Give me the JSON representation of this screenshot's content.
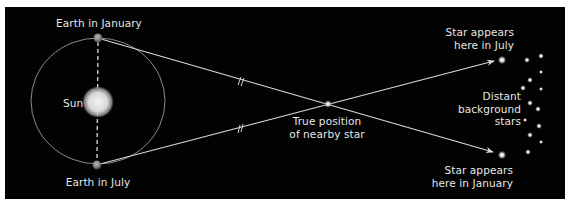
{
  "diagram": {
    "colors": {
      "background": "#020202",
      "page": "#ffffff",
      "lines": "#d9d9d9",
      "text": "#e6e6e6",
      "sun": "#e8e8e8",
      "earth": "#9a9a9a"
    },
    "labels": {
      "earth_january": "Earth in January",
      "earth_july": "Earth in July",
      "sun": "Sun",
      "true_position_line1": "True position",
      "true_position_line2": "of nearby star",
      "star_july_line1": "Star appears",
      "star_july_line2": "here in July",
      "star_january_line1": "Star appears",
      "star_january_line2": "here in January",
      "background_line1": "Distant",
      "background_line2": "background",
      "background_line3": "stars"
    },
    "elements": {
      "orbit": {
        "cx": 98,
        "cy": 101,
        "rx": 67,
        "ry": 63
      },
      "sun": {
        "cx": 98,
        "cy": 102,
        "r": 15
      },
      "earth_january": {
        "x": 98,
        "y": 38
      },
      "earth_july": {
        "x": 97,
        "y": 165
      },
      "nearby_star": {
        "x": 328,
        "y": 104
      },
      "apparent_star_july": {
        "x": 502,
        "y": 60
      },
      "apparent_star_january": {
        "x": 502,
        "y": 155
      },
      "background_stars": [
        [
          527,
          60
        ],
        [
          541,
          56
        ],
        [
          541,
          72
        ],
        [
          530,
          80
        ],
        [
          523,
          88
        ],
        [
          541,
          89
        ],
        [
          530,
          103
        ],
        [
          538,
          109
        ],
        [
          525,
          120
        ],
        [
          539,
          126
        ],
        [
          530,
          135
        ],
        [
          541,
          142
        ],
        [
          528,
          152
        ]
      ]
    }
  }
}
